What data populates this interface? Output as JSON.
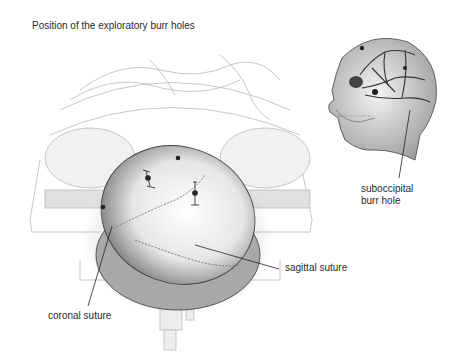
{
  "figure": {
    "title": "Position of the exploratory burr holes",
    "labels": {
      "suboccipital_line1": "suboccipital",
      "suboccipital_line2": "burr hole",
      "sagittal": "sagittal suture",
      "coronal": "coronal suture"
    },
    "panels": [
      {
        "name": "main-view",
        "description": "Patient positioned on operating table, top of skull viewed with burr holes marked"
      },
      {
        "name": "inset-view",
        "description": "Lateral skull view with vessels, suboccipital burr hole indicated"
      }
    ],
    "colors": {
      "ink": "#2a2a2a",
      "shade": "#9a9a9a",
      "light": "#d8d8d8",
      "background": "#ffffff"
    }
  }
}
